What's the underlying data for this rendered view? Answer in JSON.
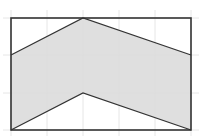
{
  "figure": {
    "colors": {
      "background": "#ffffff",
      "grid": "#e6e6e6",
      "fill": "#dcdcdc",
      "stroke": "#333333"
    },
    "grid": {
      "columns": 5,
      "rows": 3,
      "x_lines": [
        11,
        47,
        83,
        119,
        155,
        191
      ],
      "y_lines": [
        18,
        55,
        93,
        130
      ]
    },
    "rectangle": {
      "x": 11,
      "y": 18,
      "width": 180,
      "height": 112
    },
    "shaded_region": {
      "points": [
        [
          11,
          55
        ],
        [
          83,
          18
        ],
        [
          191,
          55
        ],
        [
          191,
          130
        ],
        [
          83,
          93
        ],
        [
          11,
          130
        ]
      ]
    },
    "lines": {
      "upper": [
        [
          11,
          55
        ],
        [
          83,
          18
        ],
        [
          191,
          55
        ]
      ],
      "lower": [
        [
          11,
          130
        ],
        [
          83,
          93
        ],
        [
          191,
          130
        ]
      ]
    }
  }
}
